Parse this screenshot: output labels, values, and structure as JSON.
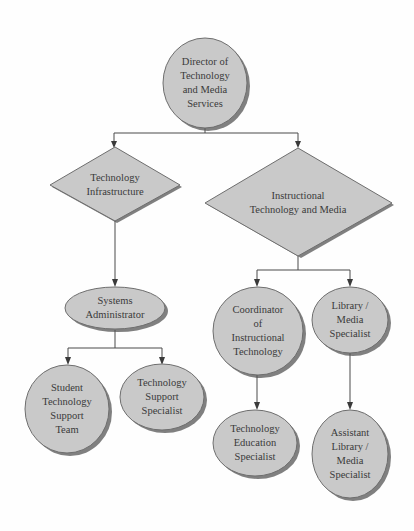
{
  "diagram": {
    "type": "org-chart",
    "colors": {
      "node_fill": "#c9c9c9",
      "node_border": "#6e6e6e",
      "shadow": "#555555",
      "connector": "#4a4a4a",
      "text": "#3a3a3a"
    },
    "nodes": {
      "director": {
        "shape": "circle",
        "label": "Director of\nTechnology\nand Media\nServices"
      },
      "tech_infrastructure": {
        "shape": "diamond",
        "label": "Technology\nInfrastructure"
      },
      "instructional_tech": {
        "shape": "diamond",
        "label": "Instructional\nTechnology and Media"
      },
      "systems_admin": {
        "shape": "ellipse",
        "label": "Systems\nAdministrator"
      },
      "student_support_team": {
        "shape": "ellipse",
        "label": "Student\nTechnology\nSupport\nTeam"
      },
      "tech_support_specialist": {
        "shape": "ellipse",
        "label": "Technology\nSupport\nSpecialist"
      },
      "coordinator": {
        "shape": "ellipse",
        "label": "Coordinator\nof\nInstructional\nTechnology"
      },
      "library_media": {
        "shape": "ellipse",
        "label": "Library /\nMedia\nSpecialist"
      },
      "tech_education_specialist": {
        "shape": "ellipse",
        "label": "Technology\nEducation\nSpecialist"
      },
      "assistant_library": {
        "shape": "ellipse",
        "label": "Assistant\nLibrary /\nMedia\nSpecialist"
      }
    },
    "edges": [
      {
        "from": "director",
        "to": "tech_infrastructure"
      },
      {
        "from": "director",
        "to": "instructional_tech"
      },
      {
        "from": "tech_infrastructure",
        "to": "systems_admin"
      },
      {
        "from": "systems_admin",
        "to": "student_support_team"
      },
      {
        "from": "systems_admin",
        "to": "tech_support_specialist"
      },
      {
        "from": "instructional_tech",
        "to": "coordinator"
      },
      {
        "from": "instructional_tech",
        "to": "library_media"
      },
      {
        "from": "coordinator",
        "to": "tech_education_specialist"
      },
      {
        "from": "library_media",
        "to": "assistant_library"
      }
    ]
  }
}
